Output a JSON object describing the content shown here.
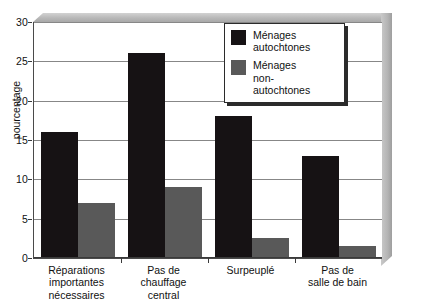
{
  "chart_data": {
    "type": "bar",
    "title": "",
    "xlabel": "",
    "ylabel": "pourcentage",
    "ylim": [
      0,
      30
    ],
    "yticks": [
      0,
      5,
      10,
      15,
      20,
      25,
      30
    ],
    "grid": true,
    "legend_position": "top-right",
    "categories": [
      "Réparations\nimportantes\nnécessaires",
      "Pas de\nchauffage\ncentral",
      "Surpeuplé",
      "Pas de\nsalle de bain"
    ],
    "category_lines": [
      [
        "Réparations",
        "importantes",
        "nécessaires"
      ],
      [
        "Pas de",
        "chauffage",
        "central"
      ],
      [
        "Surpeuplé"
      ],
      [
        "Pas de",
        "salle de bain"
      ]
    ],
    "series": [
      {
        "name": "Ménages autochtones",
        "name_lines": [
          "Ménages",
          "autochtones"
        ],
        "color": "#161214",
        "values": [
          16,
          26,
          18,
          13
        ]
      },
      {
        "name": "Ménages non-autochtones",
        "name_lines": [
          "Ménages",
          "non-",
          "autochtones"
        ],
        "color": "#595959",
        "values": [
          7,
          9,
          2.5,
          1.5
        ]
      }
    ]
  },
  "colors": {
    "background": "#ffffff",
    "axis": "#3a3a3a",
    "gridline": "#878787",
    "wall": "#b8b8b8",
    "series_primary": "#161214",
    "series_secondary": "#595959"
  }
}
